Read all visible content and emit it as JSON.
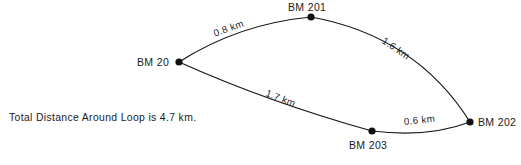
{
  "diagram": {
    "type": "survey-level-loop",
    "caption": "Total Distance Around Loop is 4.7 km.",
    "total_distance_km": 4.7,
    "units": "km",
    "stroke_color": "#171717",
    "node_color": "#111111",
    "background_color": "#ffffff",
    "nodes": [
      {
        "id": "bm20",
        "label": "BM 20",
        "x": 179,
        "y": 62,
        "label_x": 137,
        "label_y": 57
      },
      {
        "id": "bm201",
        "label": "BM 201",
        "x": 311,
        "y": 17,
        "label_x": 288,
        "label_y": 2
      },
      {
        "id": "bm202",
        "label": "BM 202",
        "x": 470,
        "y": 122,
        "label_x": 478,
        "label_y": 117
      },
      {
        "id": "bm203",
        "label": "BM 203",
        "x": 372,
        "y": 131,
        "label_x": 349,
        "label_y": 140
      }
    ],
    "edges": [
      {
        "id": "bm20-bm201",
        "from": "BM 20",
        "to": "BM 201",
        "label": "0.8 km",
        "distance_km": 0.8,
        "path": "M 179 62 Q 238 24 311 17",
        "label_x": 214,
        "label_y": 29,
        "label_rotation": -20
      },
      {
        "id": "bm201-bm202",
        "from": "BM 201",
        "to": "BM 202",
        "label": "1.6 km",
        "distance_km": 1.6,
        "path": "M 311 17 Q 416 36 470 122",
        "label_x": 383,
        "label_y": 35,
        "label_rotation": 34
      },
      {
        "id": "bm20-bm203",
        "from": "BM 20",
        "to": "BM 203",
        "label": "1.7 km",
        "distance_km": 1.7,
        "path": "M 179 62 Q 268 102 372 131",
        "label_x": 266,
        "label_y": 88,
        "label_rotation": 21
      },
      {
        "id": "bm203-bm202",
        "from": "BM 203",
        "to": "BM 202",
        "label": "0.6 km",
        "distance_km": 0.6,
        "path": "M 372 131 Q 428 138 470 122",
        "label_x": 404,
        "label_y": 117,
        "label_rotation": -6
      }
    ]
  }
}
